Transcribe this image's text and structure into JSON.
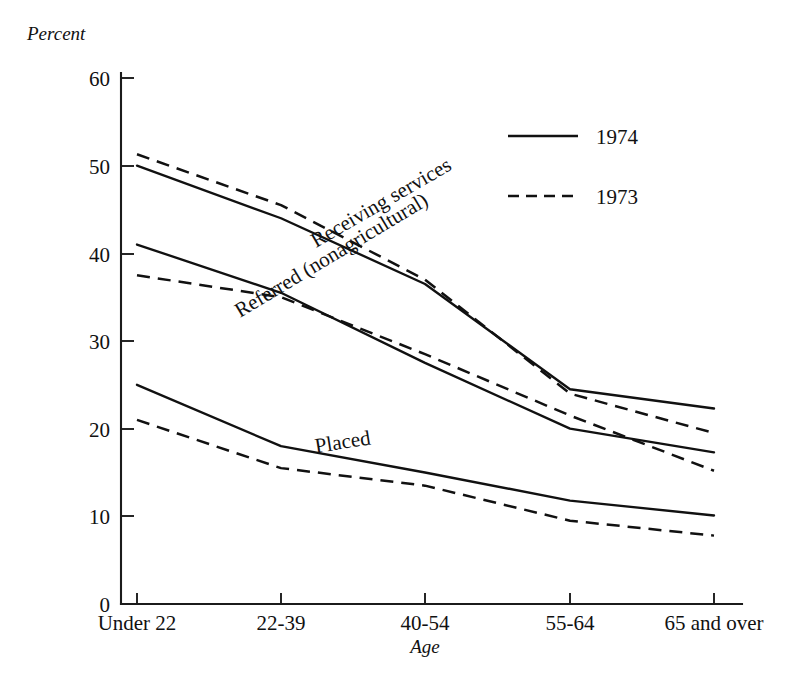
{
  "chart_data": {
    "type": "line",
    "title": "",
    "subtitle": "",
    "xlabel": "Age",
    "ylabel": "Percent",
    "categories": [
      "Under 22",
      "22-39",
      "40-54",
      "55-64",
      "65 and over"
    ],
    "ylim": [
      0,
      62
    ],
    "yticks": [
      0,
      10,
      20,
      30,
      40,
      50,
      60
    ],
    "ytick_labels": [
      "0",
      "10",
      "20",
      "30",
      "40",
      "50",
      "60"
    ],
    "grid": false,
    "legend_position": "upper right",
    "legend": [
      {
        "label": "1974",
        "style": "solid"
      },
      {
        "label": "1973",
        "style": "dashed"
      }
    ],
    "annotations": [
      {
        "text": "Receiving services",
        "rotation": -30
      },
      {
        "text": "Referred (nonagricultural)",
        "rotation": -31
      },
      {
        "text": "Placed",
        "rotation": -9
      }
    ],
    "series": [
      {
        "name": "Receiving services",
        "year": "1974",
        "style": "solid",
        "values": [
          50.0,
          44.0,
          36.5,
          24.5,
          22.3
        ]
      },
      {
        "name": "Receiving services",
        "year": "1973",
        "style": "dashed",
        "values": [
          51.3,
          45.5,
          37.0,
          24.0,
          19.5
        ]
      },
      {
        "name": "Referred (nonagricultural)",
        "year": "1974",
        "style": "solid",
        "values": [
          41.0,
          35.5,
          27.5,
          20.0,
          17.3
        ]
      },
      {
        "name": "Referred (nonagricultural)",
        "year": "1973",
        "style": "dashed",
        "values": [
          37.5,
          35.0,
          28.5,
          21.5,
          15.2
        ]
      },
      {
        "name": "Placed",
        "year": "1974",
        "style": "solid",
        "values": [
          25.0,
          18.0,
          15.0,
          11.8,
          10.1
        ]
      },
      {
        "name": "Placed",
        "year": "1973",
        "style": "dashed",
        "values": [
          21.0,
          15.5,
          13.5,
          9.5,
          7.8
        ]
      }
    ]
  },
  "axis": {
    "y_title": "Percent",
    "x_title": "Age",
    "ytick_labels": [
      "60",
      "50",
      "40",
      "30",
      "20",
      "10",
      "0"
    ],
    "xtick_labels": [
      "Under 22",
      "22-39",
      "40-54",
      "55-64",
      "65 and over"
    ]
  },
  "legend": {
    "entry_1974": "1974",
    "entry_1973": "1973"
  },
  "annotations": {
    "receiving_services": "Receiving services",
    "referred": "Referred (nonagricultural)",
    "placed": "Placed"
  }
}
